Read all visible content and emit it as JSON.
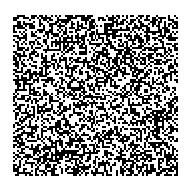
{
  "image": {
    "description": "Random black and white noise pattern",
    "background_color": "#ffffff",
    "noise": {
      "x": 13,
      "y": 15,
      "width": 165,
      "height": 161,
      "grain_px": 2,
      "colors": [
        "#000000",
        "#ffffff"
      ],
      "black_ratio": 0.5,
      "seed": 1337
    }
  }
}
